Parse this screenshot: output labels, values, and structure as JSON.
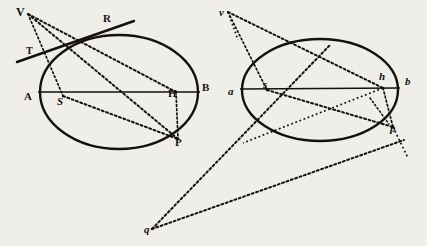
{
  "figure": {
    "background_color": "#efeee8",
    "ink_color": "#14110d",
    "width": 427,
    "height": 246
  },
  "left_figure": {
    "name": "upper-case-ellipse-figure",
    "ellipse": {
      "cx": 119,
      "cy": 92,
      "rx": 79,
      "ry": 57
    },
    "labels": [
      {
        "id": "V",
        "text": "V",
        "x": 16,
        "y": 16,
        "style": "roman",
        "size": 12
      },
      {
        "id": "T",
        "text": "T",
        "x": 26,
        "y": 54,
        "style": "roman",
        "size": 10
      },
      {
        "id": "R",
        "text": "R",
        "x": 103,
        "y": 22,
        "style": "roman",
        "size": 11
      },
      {
        "id": "A",
        "text": "A",
        "x": 24,
        "y": 100,
        "style": "roman",
        "size": 11
      },
      {
        "id": "S",
        "text": "S",
        "x": 57,
        "y": 105,
        "style": "italic",
        "size": 11
      },
      {
        "id": "H",
        "text": "H",
        "x": 168,
        "y": 97,
        "style": "roman",
        "size": 11
      },
      {
        "id": "B",
        "text": "B",
        "x": 202,
        "y": 91,
        "style": "roman",
        "size": 11
      },
      {
        "id": "P",
        "text": "P",
        "x": 175,
        "y": 146,
        "style": "roman",
        "size": 11
      }
    ],
    "points": {
      "V": [
        28,
        14
      ],
      "T": [
        17,
        62
      ],
      "R": [
        134,
        21
      ],
      "A": [
        40,
        92
      ],
      "S": [
        63,
        96
      ],
      "H": [
        176,
        92
      ],
      "B": [
        198,
        92
      ],
      "P": [
        178,
        139
      ],
      "tangency": [
        82,
        43
      ]
    }
  },
  "right_figure": {
    "name": "lower-case-ellipse-figure",
    "ellipse": {
      "cx": 320,
      "cy": 90,
      "rx": 78,
      "ry": 51
    },
    "labels": [
      {
        "id": "v",
        "text": "v",
        "x": 219,
        "y": 16,
        "style": "italic",
        "size": 11
      },
      {
        "id": "a",
        "text": "a",
        "x": 228,
        "y": 95,
        "style": "italic",
        "size": 11
      },
      {
        "id": "s",
        "text": "s",
        "x": 263,
        "y": 88,
        "style": "italic",
        "size": 11
      },
      {
        "id": "h",
        "text": "h",
        "x": 379,
        "y": 80,
        "style": "italic",
        "size": 11
      },
      {
        "id": "b",
        "text": "b",
        "x": 405,
        "y": 85,
        "style": "italic",
        "size": 11
      },
      {
        "id": "p",
        "text": "p",
        "x": 390,
        "y": 132,
        "style": "italic",
        "size": 11
      },
      {
        "id": "q",
        "text": "q",
        "x": 144,
        "y": 233,
        "style": "italic",
        "size": 11
      }
    ],
    "points": {
      "v": [
        228,
        12
      ],
      "a": [
        242,
        90
      ],
      "s": [
        267,
        90
      ],
      "h": [
        383,
        88
      ],
      "b": [
        396,
        88
      ],
      "p": [
        393,
        127
      ],
      "q": [
        152,
        229
      ]
    }
  },
  "notes": {
    "line_styles": {
      "solid": "tangent and axis lines",
      "dotted": "construction rays"
    }
  }
}
